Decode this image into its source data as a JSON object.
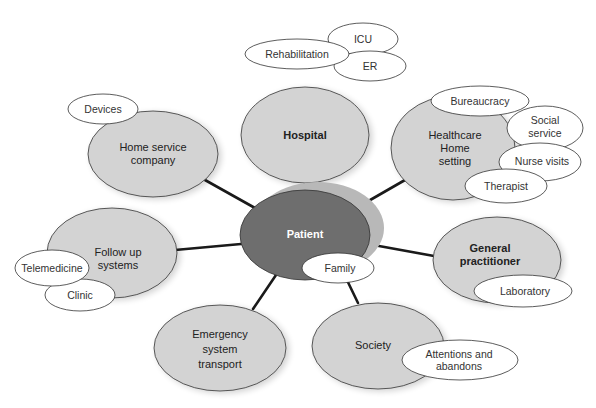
{
  "diagram": {
    "type": "hub-and-spoke concept map",
    "center": {
      "label": "Patient",
      "fill": "#6e6e6e",
      "shadow": "#b8b8b8"
    },
    "colors": {
      "node_fill": "#d3d3d3",
      "satellite_fill": "#ffffff",
      "stroke": "#333333",
      "connector": "#1a1a1a"
    },
    "nodes": [
      {
        "id": "hospital",
        "label_lines": [
          "Hospital"
        ],
        "bold": true,
        "satellites": [
          "Rehabilitation",
          "ICU",
          "ER"
        ]
      },
      {
        "id": "healthcare-home",
        "label_lines": [
          "Healthcare",
          "Home",
          "setting"
        ],
        "bold": false,
        "satellites": [
          "Bureaucracy",
          "Social service",
          "Nurse visits",
          "Therapist"
        ]
      },
      {
        "id": "general-practitioner",
        "label_lines": [
          "General",
          "practitioner"
        ],
        "bold": true,
        "satellites": [
          "Laboratory"
        ]
      },
      {
        "id": "society",
        "label_lines": [
          "Society"
        ],
        "bold": false,
        "satellites": [
          "Attentions and abandons"
        ]
      },
      {
        "id": "emergency",
        "label_lines": [
          "Emergency",
          "system",
          "transport"
        ],
        "bold": false,
        "satellites": []
      },
      {
        "id": "follow-up",
        "label_lines": [
          "Follow up",
          "systems"
        ],
        "bold": false,
        "satellites": [
          "Telemedicine",
          "Clinic"
        ]
      },
      {
        "id": "home-service",
        "label_lines": [
          "Home service",
          "company"
        ],
        "bold": false,
        "satellites": [
          "Devices"
        ]
      }
    ],
    "center_satellites": [
      "Family"
    ],
    "labels": {
      "patient": "Patient",
      "hospital": "Hospital",
      "rehabilitation": "Rehabilitation",
      "icu": "ICU",
      "er": "ER",
      "healthcare_1": "Healthcare",
      "healthcare_2": "Home",
      "healthcare_3": "setting",
      "bureaucracy": "Bureaucracy",
      "social_1": "Social",
      "social_2": "service",
      "nurse_visits": "Nurse visits",
      "therapist": "Therapist",
      "gp_1": "General",
      "gp_2": "practitioner",
      "laboratory": "Laboratory",
      "society": "Society",
      "attentions_1": "Attentions and",
      "attentions_2": "abandons",
      "emergency_1": "Emergency",
      "emergency_2": "system",
      "emergency_3": "transport",
      "followup_1": "Follow up",
      "followup_2": "systems",
      "telemedicine": "Telemedicine",
      "clinic": "Clinic",
      "homeservice_1": "Home service",
      "homeservice_2": "company",
      "devices": "Devices",
      "family": "Family"
    }
  }
}
